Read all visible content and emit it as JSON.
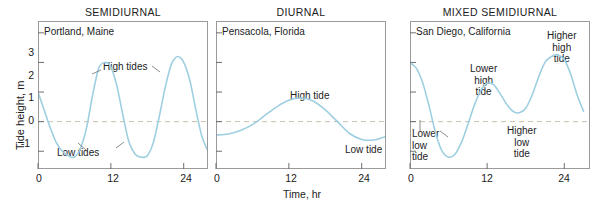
{
  "figure": {
    "xaxis_title": "Time, hr",
    "yaxis_title": "Tide height, m"
  },
  "chart_data": {
    "type": "line",
    "title": "",
    "xlabel": "Time, hr",
    "ylabel": "Tide height, m",
    "xlim": [
      0,
      28
    ],
    "ylim": [
      -1.6,
      3.4
    ],
    "xticks": [
      0,
      12,
      24
    ],
    "yticks": [
      -1,
      0,
      1,
      2,
      3
    ],
    "grid": false,
    "zero_reference_line": true,
    "legend": "none",
    "panels": [
      {
        "id": "semidiurnal",
        "title": "SEMIDIURNAL",
        "place": "Portland, Maine",
        "xticklabels": [
          "0",
          "12",
          "24"
        ],
        "yticklabels": [
          "-1",
          "0",
          "1",
          "2",
          "3"
        ],
        "annotations": [
          {
            "name": "high-tides",
            "text": "High tides"
          },
          {
            "name": "low-tides",
            "text": "Low tides"
          }
        ],
        "series": [
          {
            "name": "Portland tide height",
            "x": [
              0,
              1,
              2,
              3,
              4,
              5,
              6,
              7,
              8,
              9,
              10,
              11,
              12,
              13,
              14,
              15,
              16,
              17,
              18,
              19,
              20,
              21,
              22,
              23,
              24,
              25,
              26,
              27,
              28
            ],
            "y": [
              1.0,
              0.4,
              -0.2,
              -0.7,
              -1.0,
              -1.15,
              -1.2,
              -0.9,
              -0.2,
              0.9,
              1.8,
              2.0,
              1.85,
              1.2,
              0.2,
              -0.7,
              -1.1,
              -1.2,
              -1.15,
              -0.7,
              0.2,
              1.2,
              1.95,
              2.2,
              2.0,
              1.4,
              0.4,
              -0.5,
              -1.0
            ]
          }
        ]
      },
      {
        "id": "diurnal",
        "title": "DIURNAL",
        "place": "Pensacola, Florida",
        "xticklabels": [
          "0",
          "12",
          "24"
        ],
        "yticklabels": [
          "-1",
          "0",
          "1",
          "2",
          "3"
        ],
        "annotations": [
          {
            "name": "high-tide",
            "text": "High tide"
          },
          {
            "name": "low-tide",
            "text": "Low tide"
          }
        ],
        "series": [
          {
            "name": "Pensacola tide height",
            "x": [
              0,
              2,
              4,
              6,
              8,
              10,
              12,
              14,
              16,
              18,
              20,
              22,
              24,
              26,
              28
            ],
            "y": [
              -0.45,
              -0.42,
              -0.3,
              -0.1,
              0.2,
              0.5,
              0.72,
              0.8,
              0.7,
              0.4,
              0.0,
              -0.4,
              -0.6,
              -0.62,
              -0.5
            ]
          }
        ]
      },
      {
        "id": "mixed-semidiurnal",
        "title": "MIXED SEMIDIURNAL",
        "place": "San Diego, California",
        "xticklabels": [
          "0",
          "12",
          "24"
        ],
        "yticklabels": [
          "-1",
          "0",
          "1",
          "2",
          "3"
        ],
        "annotations": [
          {
            "name": "lower-low-tide",
            "text": "Lower\nlow\ntide"
          },
          {
            "name": "lower-high-tide",
            "text": "Lower\nhigh\ntide"
          },
          {
            "name": "higher-low-tide",
            "text": "Higher\nlow\ntide"
          },
          {
            "name": "higher-high-tide",
            "text": "Higher\nhigh\ntide"
          }
        ],
        "series": [
          {
            "name": "San Diego tide height",
            "x": [
              0,
              1,
              2,
              3,
              4,
              5,
              6,
              7,
              8,
              9,
              10,
              11,
              12,
              13,
              14,
              15,
              16,
              17,
              18,
              19,
              20,
              21,
              22,
              23,
              24,
              25,
              26,
              27
            ],
            "y": [
              2.0,
              1.8,
              1.3,
              0.5,
              -0.4,
              -1.0,
              -1.2,
              -1.1,
              -0.7,
              -0.1,
              0.55,
              1.05,
              1.3,
              1.25,
              0.95,
              0.6,
              0.35,
              0.3,
              0.45,
              0.9,
              1.5,
              2.0,
              2.2,
              2.25,
              2.1,
              1.6,
              0.9,
              0.35
            ]
          }
        ]
      }
    ]
  },
  "colors": {
    "curve": "#9ecfe0",
    "zero_line": "#c9bfae",
    "axis": "#9a9a9a",
    "text": "#1c1c1c"
  }
}
